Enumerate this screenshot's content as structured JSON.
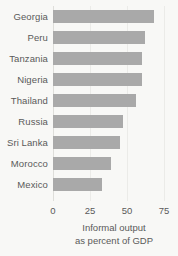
{
  "chart_data": {
    "type": "bar",
    "orientation": "horizontal",
    "title": "",
    "subtitle": "",
    "xlabel": "Informal output as percent of GDP",
    "xlabel_lines": [
      "Informal output",
      "as percent of GDP"
    ],
    "ylabel": "",
    "categories": [
      "Georgia",
      "Peru",
      "Tanzania",
      "Nigeria",
      "Thailand",
      "Russia",
      "Sri Lanka",
      "Morocco",
      "Mexico"
    ],
    "values": [
      68,
      62,
      60,
      60,
      56,
      47,
      45,
      39,
      33
    ],
    "xlim": [
      0,
      75
    ],
    "ylim": null,
    "xticks": [
      0,
      25,
      50,
      75
    ],
    "xtick_labels": [
      "0",
      "25",
      "50",
      "75"
    ],
    "grid": "vertical-light",
    "legend": null,
    "legend_position": "none",
    "bar_color": "#a9a9a9",
    "background_color": "#f8f8f6",
    "text_color": "#5a5a5a",
    "gridline_color": "#ebebe8",
    "units": "percent of GDP"
  }
}
